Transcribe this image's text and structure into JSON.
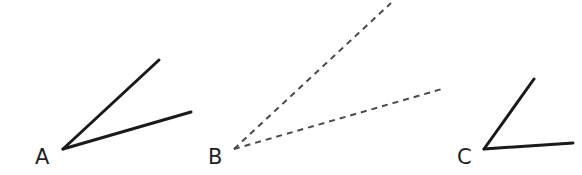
{
  "diagram": {
    "title": "",
    "stroke_color": "#1a1a1a",
    "dash_color": "#4a4a4a",
    "angles": [
      {
        "label": "A",
        "style": "solid",
        "vertex": [
          63,
          149
        ],
        "ray1_end": [
          159,
          60
        ],
        "ray2_end": [
          191,
          112
        ],
        "label_pos": [
          35,
          164
        ]
      },
      {
        "label": "B",
        "style": "dashed",
        "vertex": [
          234,
          149
        ],
        "ray1_end": [
          391,
          3
        ],
        "ray2_end": [
          442,
          89
        ],
        "label_pos": [
          208,
          164
        ]
      },
      {
        "label": "C",
        "style": "solid",
        "vertex": [
          484,
          149
        ],
        "ray1_end": [
          534,
          79
        ],
        "ray2_end": [
          573,
          143
        ],
        "label_pos": [
          457,
          164
        ]
      }
    ]
  }
}
